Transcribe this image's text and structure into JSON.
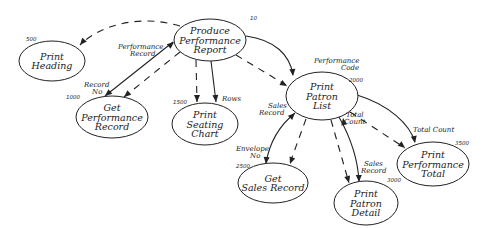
{
  "nodes": [
    {
      "id": "produce",
      "lines": [
        "Produce",
        "Performance",
        "Report"
      ],
      "number": "10",
      "cx": 210,
      "cy": 40,
      "rx": 36,
      "ry": 21,
      "num_x": 250,
      "num_y": 20
    },
    {
      "id": "heading",
      "lines": [
        "Print",
        "Heading"
      ],
      "number": "500",
      "cx": 52,
      "cy": 61,
      "rx": 33,
      "ry": 20,
      "num_x": 26,
      "num_y": 41
    },
    {
      "id": "getperf",
      "lines": [
        "Get",
        "Performance",
        "Record"
      ],
      "number": "1000",
      "cx": 112,
      "cy": 117,
      "rx": 36,
      "ry": 21,
      "num_x": 66,
      "num_y": 99
    },
    {
      "id": "seating",
      "lines": [
        "Print",
        "Seating",
        "Chart"
      ],
      "number": "1500",
      "cx": 205,
      "cy": 124,
      "rx": 33,
      "ry": 21,
      "num_x": 173,
      "num_y": 104
    },
    {
      "id": "patronlist",
      "lines": [
        "Print",
        "Patron",
        "List"
      ],
      "number": "2000",
      "cx": 322,
      "cy": 96,
      "rx": 36,
      "ry": 24,
      "num_x": 349,
      "num_y": 82
    },
    {
      "id": "getsales",
      "lines": [
        "Get",
        "Sales Record"
      ],
      "number": "2500",
      "cx": 273,
      "cy": 183,
      "rx": 35,
      "ry": 20,
      "num_x": 236,
      "num_y": 168
    },
    {
      "id": "patrondetail",
      "lines": [
        "Print",
        "Patron",
        "Detail"
      ],
      "number": "3000",
      "cx": 366,
      "cy": 203,
      "rx": 32,
      "ry": 22,
      "num_x": 387,
      "num_y": 182
    },
    {
      "id": "perftotal",
      "lines": [
        "Print",
        "Performance",
        "Total"
      ],
      "number": "3500",
      "cx": 433,
      "cy": 164,
      "rx": 36,
      "ry": 22,
      "num_x": 455,
      "num_y": 145
    }
  ],
  "flows": [
    {
      "id": "produce-heading",
      "style": "dashed",
      "path": "M180,26 C140,14 100,25 80,45",
      "arrow": {
        "x": 80,
        "y": 45,
        "angle": 130
      }
    },
    {
      "id": "getperf-produce",
      "style": "solid",
      "path": "M105,96 L173,42",
      "arrow": {
        "x": 174,
        "y": 42,
        "angle": -40
      },
      "arrow2": {
        "x": 105,
        "y": 96,
        "angle": 140
      }
    },
    {
      "id": "produce-getperf-dashed",
      "style": "dashed",
      "path": "M180,52 L124,97",
      "arrow": {
        "x": 124,
        "y": 97,
        "angle": 140
      }
    },
    {
      "id": "produce-seating-dashed",
      "style": "dashed",
      "path": "M196,60 L197,102",
      "arrow": {
        "x": 197,
        "y": 102,
        "angle": 90
      }
    },
    {
      "id": "produce-seating-solid",
      "style": "solid",
      "path": "M211,61 L216,102",
      "arrow": {
        "x": 216,
        "y": 102,
        "angle": 85
      }
    },
    {
      "id": "produce-patronlist-solid",
      "style": "solid",
      "path": "M246,36 C275,40 290,55 293,75",
      "arrow": {
        "x": 293,
        "y": 76,
        "angle": 85
      }
    },
    {
      "id": "produce-patronlist-dashed",
      "style": "dashed",
      "path": "M236,55 L286,85",
      "arrow": {
        "x": 287,
        "y": 86,
        "angle": 30
      }
    },
    {
      "id": "getsales-patronlist",
      "style": "solid",
      "path": "M266,163 C270,140 280,125 295,113",
      "arrow": {
        "x": 295,
        "y": 113,
        "angle": -45
      },
      "arrow2": {
        "x": 266,
        "y": 164,
        "angle": 95
      }
    },
    {
      "id": "patronlist-getsales-dashed",
      "style": "dashed",
      "path": "M306,119 L290,163",
      "arrow": {
        "x": 290,
        "y": 164,
        "angle": 110
      }
    },
    {
      "id": "patronlist-detail-dashed",
      "style": "dashed",
      "path": "M331,120 L349,183",
      "arrow": {
        "x": 349,
        "y": 183,
        "angle": 75
      }
    },
    {
      "id": "patronlist-detail-solid",
      "style": "solid",
      "path": "M339,117 C352,140 358,160 359,182",
      "arrow": {
        "x": 359,
        "y": 182,
        "angle": 88
      }
    },
    {
      "id": "detail-patronlist-totalcount",
      "style": "solid",
      "path": "M343,118 L343,118",
      "arrow": {
        "x": 343,
        "y": 118,
        "angle": -100
      }
    },
    {
      "id": "patronlist-perftotal-dashed",
      "style": "dashed",
      "path": "M350,112 L405,148",
      "arrow": {
        "x": 405,
        "y": 148,
        "angle": 40
      }
    },
    {
      "id": "patronlist-perftotal-solid",
      "style": "solid",
      "path": "M357,95 C390,105 410,125 415,142",
      "arrow": {
        "x": 415,
        "y": 143,
        "angle": 80
      }
    }
  ],
  "flow_labels": [
    {
      "text": "Performance",
      "x": 118,
      "y": 49
    },
    {
      "text": "Record",
      "x": 130,
      "y": 56
    },
    {
      "text": "Record",
      "x": 84,
      "y": 87
    },
    {
      "text": "No",
      "x": 92,
      "y": 94
    },
    {
      "text": "Rows",
      "x": 222,
      "y": 101
    },
    {
      "text": "Performance",
      "x": 314,
      "y": 63
    },
    {
      "text": "Code",
      "x": 341,
      "y": 70
    },
    {
      "text": "Sales",
      "x": 268,
      "y": 108
    },
    {
      "text": "Record",
      "x": 259,
      "y": 115
    },
    {
      "text": "Total",
      "x": 346,
      "y": 117
    },
    {
      "text": "Count",
      "x": 344,
      "y": 124
    },
    {
      "text": "Total Count",
      "x": 413,
      "y": 132
    },
    {
      "text": "Envelope",
      "x": 236,
      "y": 151
    },
    {
      "text": "No",
      "x": 250,
      "y": 158
    },
    {
      "text": "Sales",
      "x": 364,
      "y": 166
    },
    {
      "text": "Record",
      "x": 361,
      "y": 173
    }
  ]
}
